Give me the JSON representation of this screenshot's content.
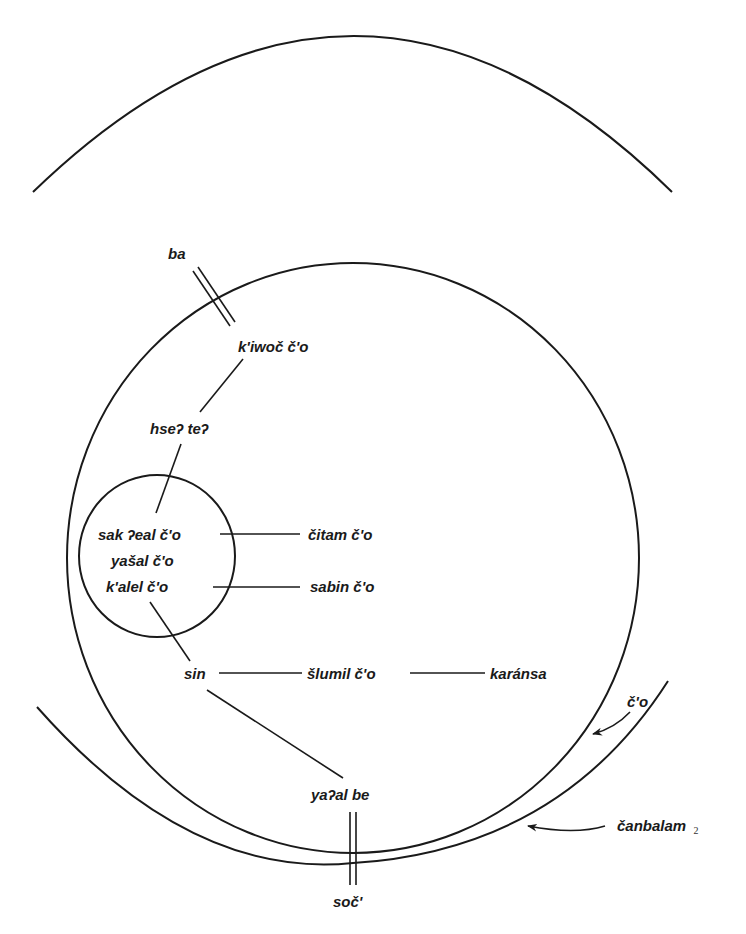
{
  "diagram": {
    "type": "concentric-cosmology-diagram",
    "colors": {
      "line": "#1a1a1a",
      "background": "#ffffff"
    },
    "regions": {
      "outer_top_arc": {
        "label": ""
      },
      "main_circle": {
        "label": "č'o"
      },
      "outer_bottom_arc": {
        "label": "čanbalam",
        "subscript": "2"
      },
      "inner_circle": {
        "label": ""
      }
    },
    "nodes": {
      "ba": "ba",
      "kiwoc": "k'iwoč č'o",
      "hse_te": "hseʔ teʔ",
      "sak_eal": "sak ʔeal č'o",
      "yasal": "yašal č'o",
      "kalel": "k'alel č'o",
      "citam": "čitam č'o",
      "sabin": "sabin č'o",
      "sin": "sin",
      "slumil": "šlumil č'o",
      "karansa": "karánsa",
      "yaal_be": "yaʔal be",
      "soc": "soč'"
    },
    "edges": [
      [
        "ba",
        "kiwoc"
      ],
      [
        "kiwoc",
        "hse_te"
      ],
      [
        "hse_te",
        "sak_eal"
      ],
      [
        "sak_eal",
        "citam"
      ],
      [
        "kalel",
        "sabin"
      ],
      [
        "kalel",
        "sin"
      ],
      [
        "sin",
        "slumil"
      ],
      [
        "slumil",
        "karansa"
      ],
      [
        "sin",
        "yaal_be"
      ],
      [
        "yaal_be",
        "soc"
      ]
    ],
    "annotations": {
      "co_pointer": "č'o",
      "canbalam_pointer": "čanbalam",
      "canbalam_subscript": "2"
    }
  }
}
